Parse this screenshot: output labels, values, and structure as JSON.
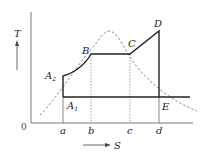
{
  "diagram": {
    "axes": {
      "y_label": "T",
      "x_label": "S",
      "origin_label": "0"
    },
    "x_ticks": [
      "a",
      "b",
      "c",
      "d"
    ],
    "points": {
      "A1": {
        "name": "A",
        "sub": "1"
      },
      "A2": {
        "name": "A",
        "sub": "2"
      },
      "B": {
        "name": "B"
      },
      "C": {
        "name": "C"
      },
      "D": {
        "name": "D"
      },
      "E": {
        "name": "E"
      }
    },
    "cycle_path": [
      "A1",
      "A2",
      "B",
      "C",
      "D",
      "E",
      "A1"
    ],
    "curves": {
      "saturation_dome": "dashed bell curve",
      "cycle": "solid thick line"
    },
    "colors": {
      "line": "#222222",
      "axis": "#555555",
      "dashed": "#555555"
    }
  }
}
